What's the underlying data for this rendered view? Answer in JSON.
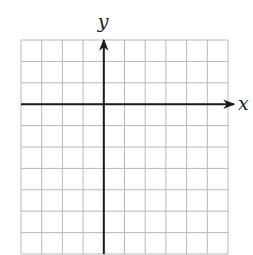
{
  "diagram": {
    "type": "coordinate-grid",
    "grid": {
      "columns": 10,
      "rows": 10,
      "left": 21,
      "top": 40,
      "cell_width": 20.7,
      "cell_height": 21.4,
      "line_color": "#b8b8b8",
      "axis_color": "#1a1a1a"
    },
    "axes": {
      "x_label": "x",
      "y_label": "y",
      "origin_column": 4,
      "origin_row": 3
    }
  }
}
